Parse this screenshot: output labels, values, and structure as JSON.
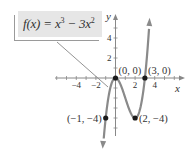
{
  "chart_data": {
    "type": "line",
    "function_label": {
      "prefix": "f(x) = x",
      "exp1": "3",
      "middle": " − 3x",
      "exp2": "2"
    },
    "xlabel": "x",
    "ylabel": "y",
    "xlim": [
      -6,
      7
    ],
    "ylim": [
      -6,
      6.5
    ],
    "x_ticks": [
      -4,
      -2,
      2,
      4
    ],
    "x_tick_labels": [
      "−4",
      "−2",
      "2",
      "4"
    ],
    "y_ticks": [
      2,
      4
    ],
    "y_tick_labels": [
      "2",
      "4"
    ],
    "grid": false,
    "legend": "callout box top-left with leader line to curve",
    "series": [
      {
        "name": "f(x) = x^3 - 3x^2",
        "color": "#8a8a8a",
        "x": [
          -1.35,
          -1,
          -0.5,
          0,
          0.5,
          1,
          1.5,
          2,
          2.5,
          3,
          3.45
        ],
        "values": [
          -7.93,
          -4,
          -0.875,
          0,
          -0.625,
          -2,
          -3.375,
          -4,
          -3.125,
          0,
          5.36
        ]
      }
    ],
    "points": [
      {
        "x": 0,
        "y": 0,
        "label": "(0, 0)"
      },
      {
        "x": 3,
        "y": 0,
        "label": "(3, 0)"
      },
      {
        "x": -1,
        "y": -4,
        "label": "(−1, −4)"
      },
      {
        "x": 2,
        "y": -4,
        "label": "(2, −4)"
      }
    ],
    "colors": {
      "curve": "#8a8a8a",
      "axis": "#888888",
      "point": "#1a1a1a",
      "box": "#e6e6e6"
    }
  }
}
